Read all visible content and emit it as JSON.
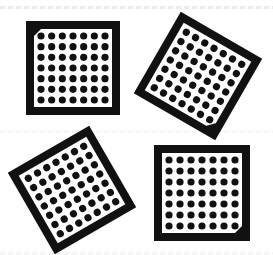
{
  "figure": {
    "background_color": "#ffffff",
    "frame_color": "#111111",
    "dot_color": "#111111",
    "grid": {
      "rows": 7,
      "cols": 7
    },
    "tiles": [
      {
        "id": "top-left",
        "cx": 73,
        "cy": 68,
        "size": 94,
        "rotation": 0,
        "chamfer_corner": "top-left"
      },
      {
        "id": "top-right",
        "cx": 198,
        "cy": 76,
        "size": 94,
        "rotation": 30,
        "chamfer_corner": "right"
      },
      {
        "id": "bottom-left",
        "cx": 72,
        "cy": 190,
        "size": 94,
        "rotation": -30,
        "chamfer_corner": "none-visible"
      },
      {
        "id": "bottom-right",
        "cx": 202,
        "cy": 193,
        "size": 96,
        "rotation": 0,
        "chamfer_corner": "bottom-right"
      }
    ]
  }
}
